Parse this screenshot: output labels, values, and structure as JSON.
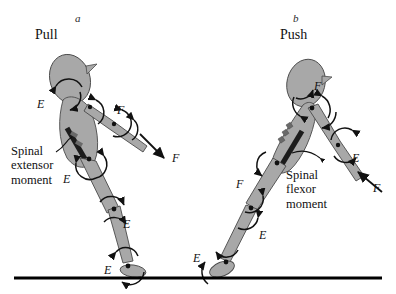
{
  "figure": {
    "background_color": "#ffffff",
    "segment_fill": "#a8a8a8",
    "segment_stroke": "#3a3a3a",
    "muscle_color": "#1c1c1c",
    "ground_color": "#000000",
    "panels": [
      {
        "id": "a",
        "letter": "a",
        "title": "Pull",
        "letter_pos": {
          "x": 75,
          "y": 12
        },
        "title_pos": {
          "x": 35,
          "y": 27
        },
        "caption": {
          "lines": [
            "Spinal",
            "extensor",
            "moment"
          ],
          "x": 11,
          "y": 144
        },
        "joint_labels": [
          {
            "text": "E",
            "x": 37,
            "y": 98,
            "name": "neck-moment-label-a"
          },
          {
            "text": "F",
            "x": 117,
            "y": 104,
            "name": "shoulder-moment-label-a"
          },
          {
            "text": "F",
            "x": 172,
            "y": 152,
            "name": "hand-force-label-a"
          },
          {
            "text": "E",
            "x": 63,
            "y": 173,
            "name": "hip-moment-label-a"
          },
          {
            "text": "E",
            "x": 123,
            "y": 218,
            "name": "knee-moment-label-a"
          },
          {
            "text": "E",
            "x": 104,
            "y": 264,
            "name": "ankle-moment-label-a"
          }
        ]
      },
      {
        "id": "b",
        "letter": "b",
        "title": "Push",
        "letter_pos": {
          "x": 293,
          "y": 12
        },
        "title_pos": {
          "x": 280,
          "y": 27
        },
        "caption": {
          "lines": [
            "Spinal",
            "flexor",
            "moment"
          ],
          "x": 286,
          "y": 168
        },
        "joint_labels": [
          {
            "text": "F",
            "x": 314,
            "y": 80,
            "name": "neck-moment-label-b"
          },
          {
            "text": "E",
            "x": 352,
            "y": 152,
            "name": "elbow-moment-label-b"
          },
          {
            "text": "F",
            "x": 373,
            "y": 182,
            "name": "hand-force-label-b"
          },
          {
            "text": "F",
            "x": 236,
            "y": 178,
            "name": "hip-moment-label-b"
          },
          {
            "text": "E",
            "x": 259,
            "y": 229,
            "name": "knee-moment-label-b"
          },
          {
            "text": "E",
            "x": 193,
            "y": 252,
            "name": "ankle-moment-label-b"
          }
        ]
      }
    ],
    "ground": {
      "x1": 14,
      "x2": 382,
      "y": 278,
      "thickness": 3
    }
  }
}
